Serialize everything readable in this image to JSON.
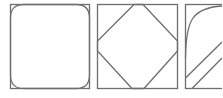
{
  "diagram": {
    "stroke_color": "#6e6e6e",
    "background": "#ffffff",
    "panels": [
      {
        "id": "panel-1",
        "shape": "rounded-square-inset",
        "description": "square frame with rounded inner square"
      },
      {
        "id": "panel-2",
        "shape": "octagon-diamond",
        "description": "square frame with inscribed diamond/octagon"
      },
      {
        "id": "panel-3",
        "shape": "curve-and-diagonals",
        "description": "square frame with easing curve and two diagonal lines (clipped)"
      }
    ]
  }
}
